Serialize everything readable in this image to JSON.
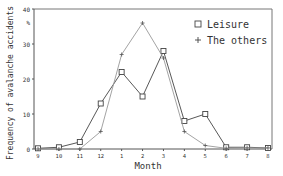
{
  "chart_data": {
    "type": "line",
    "title": "",
    "xlabel": "Month",
    "ylabel": "Frequency of avalanche accidents",
    "yunit": "%",
    "ylim": [
      0,
      40
    ],
    "yticks": [
      0,
      10,
      20,
      30,
      40
    ],
    "categories": [
      "9",
      "10",
      "11",
      "12",
      "1",
      "2",
      "3",
      "4",
      "5",
      "6",
      "7",
      "8"
    ],
    "grid": false,
    "legend_position": "upper right",
    "series": [
      {
        "name": "Leisure",
        "marker": "square",
        "color": "#444444",
        "values": [
          0.2,
          0.5,
          2,
          13,
          22,
          15,
          28,
          8,
          10,
          0.5,
          0.5,
          0.3
        ]
      },
      {
        "name": "The others",
        "marker": "plus",
        "color": "#999999",
        "values": [
          0,
          0,
          0,
          5,
          27,
          36,
          26,
          5,
          1,
          0.2,
          0.3,
          0.3
        ]
      }
    ]
  }
}
